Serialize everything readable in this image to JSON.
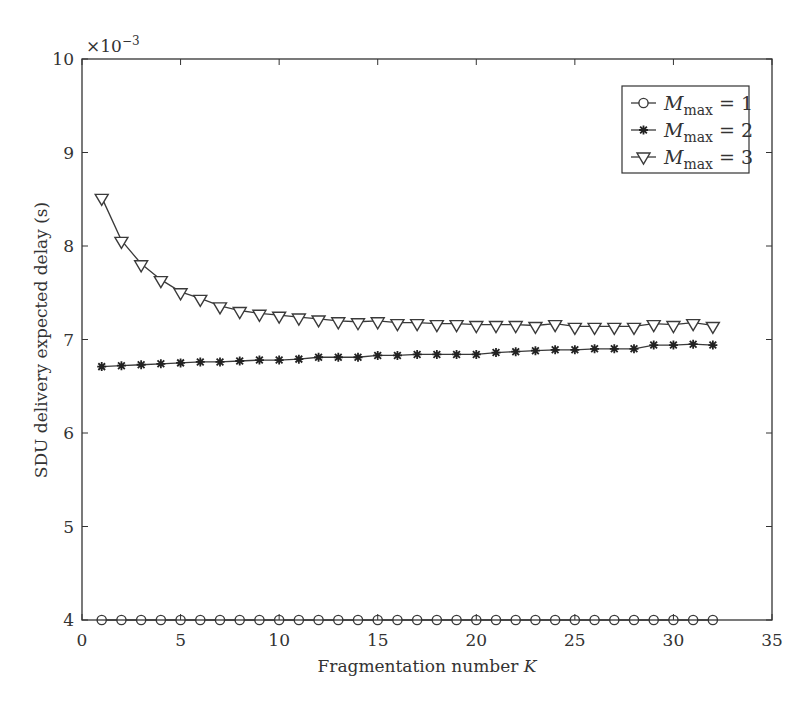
{
  "chart_data": {
    "type": "line",
    "title": "",
    "xlabel": "Fragmentation number K",
    "xlabel_main": "Fragmentation number ",
    "xlabel_var": "K",
    "ylabel": "SDU delivery expected delay (s)",
    "y_multiplier": "×10−3",
    "y_multiplier_base": "×10",
    "y_multiplier_exp": "−3",
    "xlim": [
      0,
      35
    ],
    "ylim": [
      4,
      10
    ],
    "xticks": [
      0,
      5,
      10,
      15,
      20,
      25,
      30,
      35
    ],
    "yticks": [
      4,
      5,
      6,
      7,
      8,
      9,
      10
    ],
    "grid": false,
    "legend_position": "upper right",
    "x": [
      1,
      2,
      3,
      4,
      5,
      6,
      7,
      8,
      9,
      10,
      11,
      12,
      13,
      14,
      15,
      16,
      17,
      18,
      19,
      20,
      21,
      22,
      23,
      24,
      25,
      26,
      27,
      28,
      29,
      30,
      31,
      32
    ],
    "series": [
      {
        "name": "M_max = 1",
        "label_var": "M",
        "label_sub": "max",
        "label_rest": " = 1",
        "marker": "circle",
        "values": [
          4.0,
          4.0,
          4.0,
          4.0,
          4.0,
          4.0,
          4.0,
          4.0,
          4.0,
          4.0,
          4.0,
          4.0,
          4.0,
          4.0,
          4.0,
          4.0,
          4.0,
          4.0,
          4.0,
          4.0,
          4.0,
          4.0,
          4.0,
          4.0,
          4.0,
          4.0,
          4.0,
          4.0,
          4.0,
          4.0,
          4.0,
          4.0
        ]
      },
      {
        "name": "M_max = 2",
        "label_var": "M",
        "label_sub": "max",
        "label_rest": " = 2",
        "marker": "star",
        "values": [
          6.71,
          6.72,
          6.73,
          6.74,
          6.75,
          6.76,
          6.76,
          6.77,
          6.78,
          6.78,
          6.79,
          6.81,
          6.81,
          6.81,
          6.83,
          6.83,
          6.84,
          6.84,
          6.84,
          6.84,
          6.86,
          6.87,
          6.88,
          6.89,
          6.89,
          6.9,
          6.9,
          6.9,
          6.94,
          6.94,
          6.95,
          6.94
        ]
      },
      {
        "name": "M_max = 3",
        "label_var": "M",
        "label_sub": "max",
        "label_rest": " = 3",
        "marker": "triangle-down",
        "values": [
          8.52,
          8.06,
          7.81,
          7.64,
          7.51,
          7.44,
          7.36,
          7.31,
          7.28,
          7.26,
          7.24,
          7.22,
          7.2,
          7.19,
          7.2,
          7.18,
          7.18,
          7.17,
          7.17,
          7.16,
          7.16,
          7.16,
          7.15,
          7.17,
          7.14,
          7.14,
          7.14,
          7.14,
          7.17,
          7.16,
          7.18,
          7.15
        ]
      }
    ]
  },
  "colors": {
    "line": "#3a3a3a",
    "axis": "#333333",
    "background": "#ffffff"
  }
}
